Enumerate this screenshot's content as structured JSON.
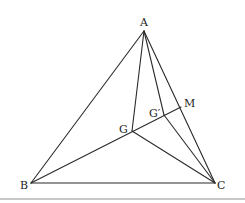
{
  "diagram": {
    "type": "geometry-triangle",
    "points": {
      "A": {
        "label": "A",
        "x": 144,
        "y": 31
      },
      "B": {
        "label": "B",
        "x": 31,
        "y": 183
      },
      "C": {
        "label": "C",
        "x": 215,
        "y": 183
      },
      "M": {
        "label": "M",
        "x": 181,
        "y": 107
      },
      "G": {
        "label": "G",
        "x": 132,
        "y": 131
      },
      "Gp": {
        "label": "G′",
        "x": 164,
        "y": 115
      }
    },
    "segments": [
      [
        "A",
        "B"
      ],
      [
        "A",
        "C"
      ],
      [
        "B",
        "C"
      ],
      [
        "A",
        "G"
      ],
      [
        "A",
        "Gp"
      ],
      [
        "B",
        "M"
      ],
      [
        "G",
        "C"
      ],
      [
        "Gp",
        "C"
      ]
    ],
    "labels": {
      "A": "A",
      "B": "B",
      "C": "C",
      "M": "M",
      "G": "G",
      "Gp": "G′"
    }
  }
}
